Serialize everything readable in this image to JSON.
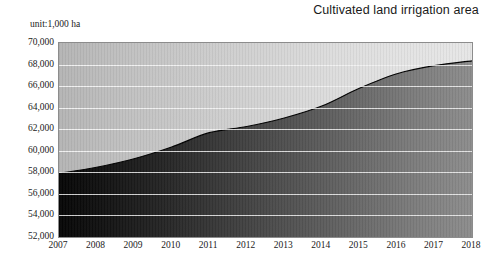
{
  "chart_data": {
    "type": "area",
    "title": "Cultivated land irrigation area",
    "unit_label": "unit:1,000 ha",
    "xlabel": "",
    "ylabel": "",
    "categories": [
      "2007",
      "2008",
      "2009",
      "2010",
      "2011",
      "2012",
      "2013",
      "2014",
      "2015",
      "2016",
      "2017",
      "2018"
    ],
    "values": [
      57900,
      58470,
      59260,
      60350,
      61680,
      62250,
      63040,
      64150,
      65800,
      67150,
      67900,
      68350
    ],
    "ylim": [
      52000,
      70000
    ],
    "ytick_step": 2000,
    "ytick_labels": [
      "70,000",
      "68,000",
      "66,000",
      "64,000",
      "62,000",
      "60,000",
      "58,000",
      "56,000",
      "54,000",
      "52,000"
    ],
    "ytick_values": [
      70000,
      68000,
      66000,
      64000,
      62000,
      60000,
      58000,
      56000,
      54000,
      52000
    ],
    "grid": true,
    "legend": "none",
    "series": [
      {
        "name": "Cultivated land irrigation area",
        "values": [
          57900,
          58470,
          59260,
          60350,
          61680,
          62250,
          63040,
          64150,
          65800,
          67150,
          67900,
          68350
        ]
      }
    ],
    "colors": {
      "area_fill_start": "#060606",
      "area_fill_end": "#8a8a8a",
      "plot_bg_start": "#b4b4b4",
      "plot_bg_end": "#e6e6e6",
      "gridline": "#f2f2f2",
      "border": "#8c8c8c",
      "line": "#000000",
      "text": "#1a1a1a"
    }
  }
}
